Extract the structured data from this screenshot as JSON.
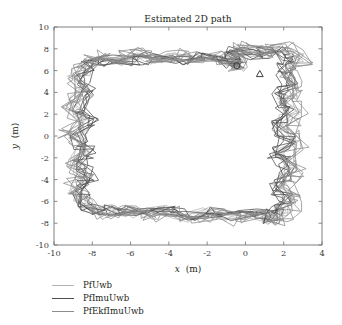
{
  "chart_data": {
    "type": "line",
    "title": "Estimated 2D path",
    "xlabel": "x (m)",
    "ylabel": "y (m)",
    "xlabel_var": "x",
    "xlabel_unit": "(m)",
    "ylabel_var": "y",
    "ylabel_unit": "(m)",
    "xlim": [
      -10,
      4
    ],
    "ylim": [
      -10,
      10
    ],
    "xticks": [
      -10,
      -8,
      -6,
      -4,
      -2,
      0,
      2,
      4
    ],
    "yticks": [
      -10,
      -8,
      -6,
      -4,
      -2,
      0,
      2,
      4,
      6,
      8,
      10
    ],
    "xtick_labels": [
      "-10",
      "-8",
      "-6",
      "-4",
      "-2",
      "0",
      "2",
      "4"
    ],
    "ytick_labels": [
      "-10",
      "-8",
      "-6",
      "-4",
      "-2",
      "0",
      "2",
      "4",
      "6",
      "8",
      "10"
    ],
    "grid": false,
    "legend_position": "below-plot",
    "markers": [
      {
        "name": "circle-marker",
        "shape": "circle",
        "x": -0.45,
        "y": 6.45
      },
      {
        "name": "triangle-marker",
        "shape": "triangle",
        "x": 0.75,
        "y": 5.7
      }
    ],
    "series": [
      {
        "name": "PfUwb",
        "color": "#b3b3b3",
        "width": 0.75,
        "points": [
          [
            -0.4,
            6.5
          ],
          [
            -1.3,
            7.2
          ],
          [
            -2.4,
            6.9
          ],
          [
            -3.5,
            7.5
          ],
          [
            -4.6,
            6.9
          ],
          [
            -5.6,
            7.4
          ],
          [
            -6.6,
            6.8
          ],
          [
            -7.5,
            7.2
          ],
          [
            -8.2,
            6.6
          ],
          [
            -8.9,
            5.2
          ],
          [
            -8.4,
            3.9
          ],
          [
            -9.0,
            2.6
          ],
          [
            -8.3,
            1.3
          ],
          [
            -9.1,
            0.1
          ],
          [
            -8.4,
            -1.2
          ],
          [
            -8.9,
            -2.5
          ],
          [
            -8.3,
            -3.8
          ],
          [
            -8.9,
            -5.0
          ],
          [
            -8.4,
            -6.2
          ],
          [
            -7.9,
            -7.0
          ],
          [
            -6.7,
            -6.6
          ],
          [
            -5.5,
            -7.2
          ],
          [
            -4.3,
            -6.7
          ],
          [
            -3.1,
            -7.5
          ],
          [
            -1.9,
            -6.9
          ],
          [
            -0.8,
            -7.6
          ],
          [
            0.3,
            -7.1
          ],
          [
            1.2,
            -7.9
          ],
          [
            1.9,
            -7.0
          ],
          [
            2.3,
            -5.6
          ],
          [
            1.7,
            -4.3
          ],
          [
            2.4,
            -3.0
          ],
          [
            1.8,
            -1.7
          ],
          [
            2.5,
            -0.4
          ],
          [
            1.8,
            0.9
          ],
          [
            2.5,
            2.2
          ],
          [
            1.9,
            3.5
          ],
          [
            2.6,
            4.7
          ],
          [
            2.1,
            6.0
          ],
          [
            2.7,
            7.2
          ],
          [
            1.9,
            8.0
          ],
          [
            0.8,
            7.5
          ],
          [
            -0.3,
            8.1
          ],
          [
            -0.5,
            7.0
          ],
          [
            -0.4,
            6.5
          ]
        ]
      },
      {
        "name": "PfImuUwb",
        "color": "#4d4d4d",
        "width": 0.8,
        "points": [
          [
            -0.45,
            6.45
          ],
          [
            -1.5,
            6.9
          ],
          [
            -2.6,
            7.3
          ],
          [
            -3.7,
            6.8
          ],
          [
            -4.8,
            7.3
          ],
          [
            -5.9,
            6.8
          ],
          [
            -6.9,
            7.1
          ],
          [
            -7.8,
            6.7
          ],
          [
            -8.3,
            6.5
          ],
          [
            -8.6,
            5.1
          ],
          [
            -8.1,
            3.8
          ],
          [
            -8.7,
            2.5
          ],
          [
            -8.1,
            1.2
          ],
          [
            -8.7,
            -0.1
          ],
          [
            -8.2,
            -1.4
          ],
          [
            -8.6,
            -2.7
          ],
          [
            -8.1,
            -4.0
          ],
          [
            -8.6,
            -5.2
          ],
          [
            -8.5,
            -6.4
          ],
          [
            -7.6,
            -6.9
          ],
          [
            -6.4,
            -6.7
          ],
          [
            -5.2,
            -7.1
          ],
          [
            -4.0,
            -6.8
          ],
          [
            -2.8,
            -7.3
          ],
          [
            -1.6,
            -6.9
          ],
          [
            -0.5,
            -7.4
          ],
          [
            0.6,
            -7.0
          ],
          [
            1.4,
            -7.6
          ],
          [
            1.8,
            -6.8
          ],
          [
            2.1,
            -5.5
          ],
          [
            1.6,
            -4.2
          ],
          [
            2.2,
            -2.9
          ],
          [
            1.6,
            -1.6
          ],
          [
            2.2,
            -0.3
          ],
          [
            1.6,
            1.0
          ],
          [
            2.2,
            2.3
          ],
          [
            1.7,
            3.6
          ],
          [
            2.3,
            4.8
          ],
          [
            1.9,
            6.1
          ],
          [
            2.4,
            7.0
          ],
          [
            1.6,
            7.9
          ],
          [
            0.5,
            7.4
          ],
          [
            -0.6,
            7.9
          ],
          [
            -0.7,
            7.0
          ],
          [
            -0.45,
            6.45
          ]
        ]
      },
      {
        "name": "PfEkfImuUwb",
        "color": "#8c8c8c",
        "width": 0.8,
        "points": [
          [
            -0.5,
            6.4
          ],
          [
            -1.4,
            7.4
          ],
          [
            -2.5,
            7.1
          ],
          [
            -3.6,
            7.6
          ],
          [
            -4.7,
            7.1
          ],
          [
            -5.7,
            7.6
          ],
          [
            -6.7,
            7.0
          ],
          [
            -7.6,
            7.4
          ],
          [
            -8.4,
            6.7
          ],
          [
            -9.2,
            5.4
          ],
          [
            -8.6,
            4.1
          ],
          [
            -9.2,
            2.8
          ],
          [
            -8.5,
            1.5
          ],
          [
            -9.3,
            0.3
          ],
          [
            -8.6,
            -1.0
          ],
          [
            -9.1,
            -2.3
          ],
          [
            -8.5,
            -3.6
          ],
          [
            -9.1,
            -4.8
          ],
          [
            -8.3,
            -6.0
          ],
          [
            -7.4,
            -7.2
          ],
          [
            -6.2,
            -6.8
          ],
          [
            -5.0,
            -7.4
          ],
          [
            -3.8,
            -6.9
          ],
          [
            -2.6,
            -7.7
          ],
          [
            -1.4,
            -7.0
          ],
          [
            -0.3,
            -7.8
          ],
          [
            0.8,
            -7.2
          ],
          [
            1.6,
            -8.1
          ],
          [
            2.1,
            -7.2
          ],
          [
            2.6,
            -5.8
          ],
          [
            2.0,
            -4.5
          ],
          [
            2.7,
            -3.2
          ],
          [
            2.1,
            -1.9
          ],
          [
            2.8,
            -0.6
          ],
          [
            2.1,
            0.7
          ],
          [
            2.8,
            2.0
          ],
          [
            2.2,
            3.3
          ],
          [
            2.9,
            4.5
          ],
          [
            2.3,
            5.8
          ],
          [
            3.0,
            7.0
          ],
          [
            2.1,
            8.2
          ],
          [
            1.0,
            7.6
          ],
          [
            -0.1,
            8.3
          ],
          [
            -0.4,
            7.1
          ],
          [
            -0.5,
            6.4
          ]
        ]
      }
    ]
  }
}
